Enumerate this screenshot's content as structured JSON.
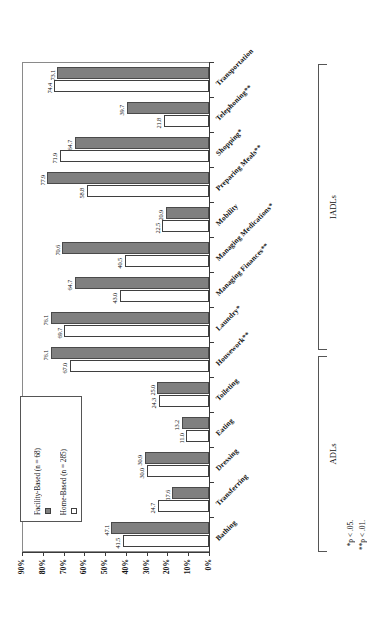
{
  "chart_data": {
    "type": "bar",
    "orientation": "horizontal-rotated",
    "title": "",
    "xlabel": "",
    "ylabel": "",
    "xlim": [
      0,
      90
    ],
    "axis_reversed": true,
    "grid": false,
    "legend_position": "inside-left",
    "categories": [
      "Transportation",
      "Telephoning**",
      "Shopping*",
      "Preparing Meals**",
      "Mobility",
      "Managing Medications*",
      "Managing Finances**",
      "Laundry*",
      "Housework**",
      "Toileting",
      "Eating",
      "Dressing",
      "Transferring",
      "Bathing"
    ],
    "series": [
      {
        "name": "Home-Based (n = 285)",
        "color": "#ffffff",
        "values": [
          74.4,
          21.8,
          71.9,
          58.8,
          22.5,
          40.5,
          43.0,
          69.7,
          67.0,
          24.3,
          11.0,
          30.0,
          24.7,
          41.5
        ]
      },
      {
        "name": "Facility-Based (n = 68)",
        "color": "#808080",
        "values": [
          73.1,
          39.7,
          64.7,
          77.9,
          20.9,
          70.6,
          64.7,
          76.1,
          76.1,
          25.0,
          13.2,
          30.9,
          17.6,
          47.1
        ]
      }
    ],
    "tick_labels": [
      "90%",
      "80%",
      "70%",
      "60%",
      "50%",
      "40%",
      "30%",
      "20%",
      "10%",
      "0%"
    ],
    "tick_values": [
      90,
      80,
      70,
      60,
      50,
      40,
      30,
      20,
      10,
      0
    ],
    "groups": [
      {
        "label": "IADLs",
        "from": 0,
        "to": 8
      },
      {
        "label": "ADLs",
        "from": 9,
        "to": 13
      }
    ],
    "annotations": [
      "*p < .05.",
      "**p < .01."
    ]
  },
  "legend": {
    "items": [
      {
        "label": "Home-Based (n = 285)",
        "swatch": "home"
      },
      {
        "label": "Facility-Based (n = 68)",
        "swatch": "facility"
      }
    ]
  },
  "footnotes": {
    "p05": "*p < .05.",
    "p01": "**p < .01."
  },
  "groups": {
    "iadls": "IADLs",
    "adls": "ADLs"
  }
}
